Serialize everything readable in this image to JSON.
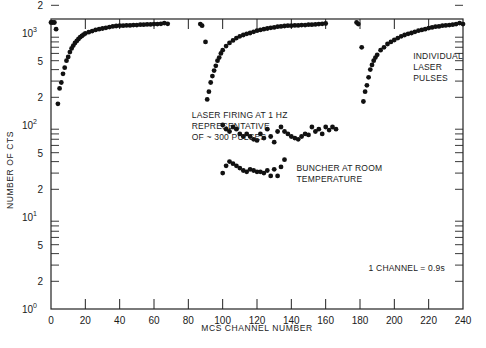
{
  "chart_data": {
    "type": "scatter",
    "title": "",
    "xlabel": "MCS CHANNEL NUMBER",
    "ylabel": "NUMBER OF CTS",
    "xlim": [
      0,
      240
    ],
    "ylim": [
      1,
      2000
    ],
    "yscale": "log",
    "grid": false,
    "x_ticks": [
      0,
      20,
      40,
      60,
      80,
      100,
      120,
      140,
      160,
      180,
      200,
      220,
      240
    ],
    "x_tick_labels": [
      "0",
      "20",
      "40",
      "60",
      "80",
      "100",
      "120",
      "140",
      "160",
      "180",
      "200",
      "220",
      "240"
    ],
    "y_tick_labels": [
      {
        "value": 1,
        "label": "10",
        "sup": "0"
      },
      {
        "value": 2,
        "label": "2",
        "sup": ""
      },
      {
        "value": 5,
        "label": "5",
        "sup": ""
      },
      {
        "value": 10,
        "label": "10",
        "sup": "1"
      },
      {
        "value": 20,
        "label": "2",
        "sup": ""
      },
      {
        "value": 50,
        "label": "5",
        "sup": ""
      },
      {
        "value": 100,
        "label": "10",
        "sup": "2"
      },
      {
        "value": 200,
        "label": "2",
        "sup": ""
      },
      {
        "value": 500,
        "label": "5",
        "sup": ""
      },
      {
        "value": 1000,
        "label": "10",
        "sup": "3"
      },
      {
        "value": 2000,
        "label": "2",
        "sup": ""
      }
    ],
    "annotations": [
      {
        "lines": [
          "LASER FIRING AT 1 HZ",
          "REPRESENTATIVE",
          "OF ~ 300 PULSES"
        ],
        "x": 82,
        "y": 120
      },
      {
        "lines": [
          "BUNCHER AT ROOM",
          "TEMPERATURE"
        ],
        "x": 143,
        "y": 32
      },
      {
        "lines": [
          "INDIVIDUAL",
          "LASER",
          "PULSES"
        ],
        "x": 211,
        "y": 520
      },
      {
        "lines": [
          "1 CHANNEL = 0.9s"
        ],
        "x": 185,
        "y": 2.6
      }
    ],
    "series": [
      {
        "name": "Individual laser pulse 1",
        "x": [
          0,
          1,
          2,
          3,
          4,
          5,
          6,
          7,
          8,
          9,
          10,
          11,
          12,
          13,
          14,
          15,
          16,
          17,
          18,
          19,
          20,
          22,
          24,
          26,
          28,
          30,
          32,
          34,
          36,
          38,
          40,
          42,
          44,
          46,
          48,
          50,
          52,
          54,
          56,
          58,
          60,
          62,
          64,
          66,
          68
        ],
        "y": [
          1300,
          1300,
          1300,
          1100,
          170,
          250,
          290,
          360,
          420,
          500,
          550,
          620,
          680,
          730,
          780,
          820,
          860,
          900,
          930,
          960,
          990,
          1020,
          1050,
          1080,
          1100,
          1120,
          1140,
          1160,
          1180,
          1190,
          1200,
          1200,
          1210,
          1210,
          1220,
          1220,
          1230,
          1230,
          1240,
          1240,
          1250,
          1250,
          1260,
          1280,
          1260
        ]
      },
      {
        "name": "Individual laser pulse 2",
        "x": [
          87,
          88,
          90,
          91,
          92,
          93,
          94,
          95,
          96,
          97,
          98,
          99,
          100,
          102,
          104,
          106,
          108,
          110,
          112,
          114,
          116,
          118,
          120,
          122,
          124,
          126,
          128,
          130,
          132,
          134,
          136,
          138,
          140,
          142,
          144,
          146,
          148,
          150,
          152,
          154,
          156,
          158,
          160
        ],
        "y": [
          1250,
          1200,
          800,
          190,
          230,
          290,
          340,
          390,
          440,
          500,
          540,
          600,
          650,
          720,
          780,
          830,
          880,
          920,
          950,
          980,
          1000,
          1030,
          1060,
          1080,
          1100,
          1120,
          1140,
          1150,
          1170,
          1180,
          1190,
          1200,
          1200,
          1210,
          1210,
          1220,
          1220,
          1230,
          1230,
          1240,
          1250,
          1260,
          1270
        ]
      },
      {
        "name": "Laser firing at 1 Hz (avg of ~300 pulses)",
        "x": [
          100,
          102,
          104,
          106,
          108,
          110,
          112,
          114,
          116,
          118,
          120,
          122,
          124,
          126,
          128,
          130,
          132,
          134,
          136,
          138,
          140,
          142,
          144,
          146,
          148,
          150,
          152,
          154,
          156,
          158,
          160,
          162,
          164,
          166
        ],
        "y": [
          100,
          90,
          85,
          95,
          90,
          80,
          75,
          80,
          75,
          70,
          68,
          80,
          72,
          90,
          75,
          65,
          85,
          95,
          85,
          80,
          75,
          72,
          70,
          75,
          80,
          78,
          95,
          85,
          90,
          80,
          95,
          88,
          95,
          90
        ]
      },
      {
        "name": "Buncher at room temperature",
        "x": [
          100,
          102,
          104,
          106,
          108,
          110,
          112,
          114,
          116,
          118,
          120,
          122,
          124,
          126,
          128,
          130,
          132,
          134,
          136
        ],
        "y": [
          30,
          36,
          40,
          38,
          36,
          34,
          32,
          31,
          33,
          32,
          31,
          31,
          30,
          32,
          28,
          33,
          28,
          35,
          42
        ]
      },
      {
        "name": "Individual laser pulse 3",
        "x": [
          178,
          179,
          181,
          182,
          183,
          184,
          185,
          186,
          187,
          188,
          189,
          190,
          192,
          194,
          196,
          198,
          200,
          202,
          204,
          206,
          208,
          210,
          212,
          214,
          216,
          218,
          220,
          222,
          224,
          226,
          228,
          230,
          232,
          234,
          236,
          238,
          240
        ],
        "y": [
          1300,
          1250,
          700,
          180,
          230,
          270,
          330,
          400,
          450,
          500,
          540,
          580,
          650,
          700,
          760,
          800,
          840,
          880,
          920,
          950,
          980,
          1000,
          1030,
          1060,
          1080,
          1100,
          1130,
          1150,
          1170,
          1180,
          1200,
          1210,
          1220,
          1230,
          1250,
          1280,
          1250
        ]
      }
    ]
  }
}
